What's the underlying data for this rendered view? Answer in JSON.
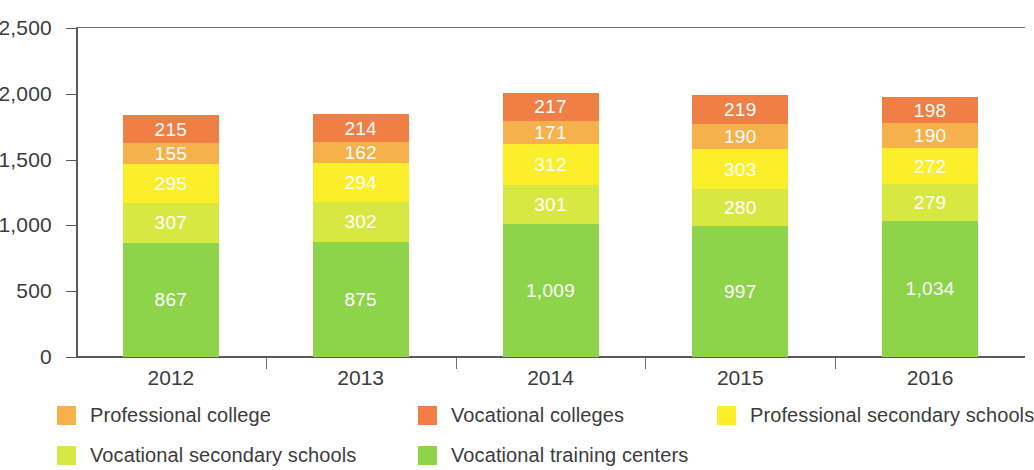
{
  "chart_data": {
    "type": "bar",
    "subtype": "stacked-vertical",
    "title": "",
    "xlabel": "",
    "ylabel": "",
    "categories": [
      "2012",
      "2013",
      "2014",
      "2015",
      "2016"
    ],
    "ylim": [
      0,
      2500
    ],
    "y_ticks": [
      0,
      500,
      1000,
      1500,
      2000,
      2500
    ],
    "y_tick_labels": [
      "0",
      "500",
      "1,000",
      "1,500",
      "2,000",
      "2,500"
    ],
    "grid": false,
    "legend_position": "bottom",
    "stack_order_bottom_to_top": [
      "Vocational training centers",
      "Vocational secondary schools",
      "Professional secondary schools",
      "Professional college",
      "Vocational colleges"
    ],
    "series": [
      {
        "name": "Vocational training centers",
        "color": "#8DD44A",
        "values": [
          867,
          875,
          1009,
          997,
          1034
        ],
        "labels": [
          "867",
          "875",
          "1,009",
          "997",
          "1,034"
        ]
      },
      {
        "name": "Vocational secondary schools",
        "color": "#D7E843",
        "values": [
          307,
          302,
          301,
          280,
          279
        ],
        "labels": [
          "307",
          "302",
          "301",
          "280",
          "279"
        ]
      },
      {
        "name": "Professional secondary schools",
        "color": "#FBEF2C",
        "values": [
          295,
          294,
          312,
          303,
          272
        ],
        "labels": [
          "295",
          "294",
          "312",
          "303",
          "272"
        ]
      },
      {
        "name": "Professional college",
        "color": "#F7B14C",
        "values": [
          155,
          162,
          171,
          190,
          190
        ],
        "labels": [
          "155",
          "162",
          "171",
          "190",
          "190"
        ]
      },
      {
        "name": "Vocational colleges",
        "color": "#F07F46",
        "values": [
          215,
          214,
          217,
          219,
          198
        ],
        "labels": [
          "215",
          "214",
          "217",
          "219",
          "198"
        ]
      }
    ],
    "totals": [
      1839,
      1847,
      2010,
      1989,
      1973
    ]
  },
  "legend": {
    "items": [
      {
        "label": "Professional college",
        "color": "#F7B14C"
      },
      {
        "label": "Vocational colleges",
        "color": "#F07F46"
      },
      {
        "label": "Professional secondary schools",
        "color": "#FBEF2C"
      },
      {
        "label": "Vocational secondary schools",
        "color": "#D7E843"
      },
      {
        "label": "Vocational training centers",
        "color": "#8DD44A"
      }
    ]
  },
  "axis": {
    "line_color": "#595959",
    "text_color": "#3c3c3c"
  }
}
